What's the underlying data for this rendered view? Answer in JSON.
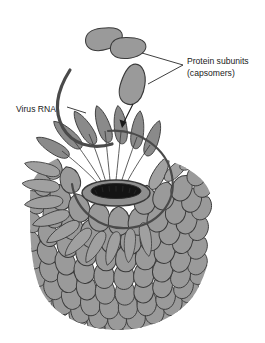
{
  "figure": {
    "background_color": "#ffffff"
  },
  "labels": {
    "protein_subunits": {
      "line1": "Protein subunits",
      "line2": "(capsomers)",
      "text_color": "#1a1a1a"
    },
    "virus_rna": {
      "line1": "Virus RNA",
      "text_color": "#1a1a1a"
    }
  },
  "colors": {
    "capsomer_fill": "#9a9a9a",
    "capsomer_fill_light": "#a8a8a8",
    "capsomer_fill_dark": "#8a8a8a",
    "capsomer_stroke": "#3a3a3a",
    "top_disk_fill": "#8e8e8e",
    "hole_fill": "#141414",
    "rna_stroke": "#4a4a4a",
    "leader_stroke": "#2a2a2a",
    "arrow_stroke": "#1a1a1a",
    "background": "#ffffff"
  },
  "annotations": {
    "assembly_arrow": "arrow-pointing-to-assembly-site",
    "leader_bracket": "bracket-to-two-free-capsomers",
    "rna_leader": "leader-line-to-rna-strand"
  },
  "free_capsomers": [
    {
      "name": "capsomer-upper-a",
      "cx": 104,
      "cy": 40
    },
    {
      "name": "capsomer-upper-b",
      "cx": 128,
      "cy": 47
    },
    {
      "name": "capsomer-middle",
      "cx": 134,
      "cy": 84
    }
  ],
  "structure": {
    "top_opening_label": "growing-helix-opening",
    "body_rows": 11,
    "body_label": "assembled-helical-capsid"
  }
}
